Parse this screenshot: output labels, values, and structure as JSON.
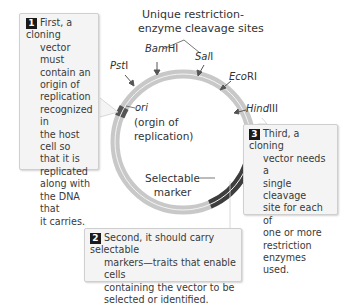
{
  "title": {
    "line1": "Unique restriction-",
    "line2": "enzyme cleavage sites"
  },
  "sites": [
    {
      "italic": "Pst",
      "roman": "I"
    },
    {
      "italic": "Bam",
      "roman": "HI"
    },
    {
      "italic": "Sal",
      "roman": "I"
    },
    {
      "italic": "Eco",
      "roman": "RI"
    },
    {
      "italic": "Hind",
      "roman": "III"
    }
  ],
  "ori": {
    "label": "ori",
    "desc_line1": "(orgin of",
    "desc_line2": "replication)"
  },
  "marker": {
    "line1": "Selectable",
    "line2": "marker"
  },
  "callouts": [
    {
      "number": "1",
      "lines": [
        "First, a cloning",
        "vector must",
        "contain an",
        "origin of",
        "replication",
        "recognized in",
        "the host cell so",
        "that it is",
        "replicated",
        "along with",
        "the DNA that",
        "it carries."
      ]
    },
    {
      "number": "2",
      "lines": [
        "Second, it should carry selectable",
        "markers—traits that enable cells",
        "containing the vector to be",
        "selected or identified."
      ]
    },
    {
      "number": "3",
      "lines": [
        "Third, a cloning",
        "vector needs a",
        "single cleavage",
        "site for each of",
        "one or more",
        "restriction",
        "enzymes used."
      ]
    }
  ],
  "colors": {
    "plasmid": "#c8c8c8",
    "plasmid_inner_line": "#f2f2f2",
    "selectable_marker": "#3d3d3d",
    "ori_segment": "#555555",
    "callout_bg": "#f4f4f4",
    "callout_border": "#cfcfcf",
    "number_badge": "#1a1a1a"
  }
}
